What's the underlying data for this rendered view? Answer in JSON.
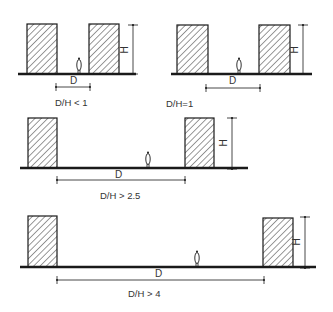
{
  "diagram": {
    "type": "architectural-section-ratios",
    "colors": {
      "ink": "#1a1a1a",
      "text": "#333333",
      "background": "#ffffff"
    },
    "panels": [
      {
        "id": "panel-1",
        "ratio_label": "D/H < 1",
        "distance_label": "D",
        "height_label": "H",
        "buildings": [
          {
            "x": 27,
            "y": 24,
            "w": 30,
            "h": 50
          },
          {
            "x": 89,
            "y": 24,
            "w": 30,
            "h": 50
          }
        ],
        "ground": {
          "x1": 18,
          "x2": 136,
          "y": 74
        },
        "person": {
          "x": 79,
          "y": 74
        },
        "d_dim": {
          "x1": 56,
          "x2": 90,
          "y": 87
        },
        "h_dim": {
          "x": 133,
          "y1": 25,
          "y2": 74
        },
        "ratio_pos": {
          "x": 55,
          "y": 106
        },
        "d_pos": {
          "x": 70,
          "y": 84
        },
        "h_pos": {
          "x": 124,
          "y": 50
        }
      },
      {
        "id": "panel-2",
        "ratio_label": "D/H=1",
        "distance_label": "D",
        "height_label": "H",
        "buildings": [
          {
            "x": 177,
            "y": 25,
            "w": 31,
            "h": 49
          },
          {
            "x": 259,
            "y": 25,
            "w": 31,
            "h": 49
          }
        ],
        "ground": {
          "x1": 171,
          "x2": 312,
          "y": 74
        },
        "person": {
          "x": 239,
          "y": 74
        },
        "d_dim": {
          "x1": 206,
          "x2": 260,
          "y": 88
        },
        "h_dim": {
          "x": 303,
          "y1": 25,
          "y2": 74
        },
        "ratio_pos": {
          "x": 166,
          "y": 107
        },
        "d_pos": {
          "x": 229,
          "y": 84
        },
        "h_pos": {
          "x": 294,
          "y": 50
        }
      },
      {
        "id": "panel-3",
        "ratio_label": "D/H > 2.5",
        "distance_label": "D",
        "height_label": "H",
        "buildings": [
          {
            "x": 28,
            "y": 118,
            "w": 29,
            "h": 50
          },
          {
            "x": 185,
            "y": 118,
            "w": 29,
            "h": 50
          }
        ],
        "ground": {
          "x1": 20,
          "x2": 248,
          "y": 168
        },
        "person": {
          "x": 148,
          "y": 168
        },
        "d_dim": {
          "x1": 57,
          "x2": 185,
          "y": 180
        },
        "h_dim": {
          "x": 232,
          "y1": 118,
          "y2": 169
        },
        "ratio_pos": {
          "x": 100,
          "y": 199
        },
        "d_pos": {
          "x": 115,
          "y": 178
        },
        "h_pos": {
          "x": 223,
          "y": 143
        }
      },
      {
        "id": "panel-4",
        "ratio_label": "D/H > 4",
        "distance_label": "D",
        "height_label": "H",
        "buildings": [
          {
            "x": 28,
            "y": 216,
            "w": 29,
            "h": 51
          },
          {
            "x": 263,
            "y": 218,
            "w": 30,
            "h": 49
          }
        ],
        "ground": {
          "x1": 20,
          "x2": 316,
          "y": 267
        },
        "person": {
          "x": 197,
          "y": 267
        },
        "d_dim": {
          "x1": 57,
          "x2": 264,
          "y": 280
        },
        "h_dim": {
          "x": 305,
          "y1": 217,
          "y2": 268
        },
        "ratio_pos": {
          "x": 128,
          "y": 297
        },
        "d_pos": {
          "x": 155,
          "y": 277
        },
        "h_pos": {
          "x": 296,
          "y": 242
        }
      }
    ]
  }
}
